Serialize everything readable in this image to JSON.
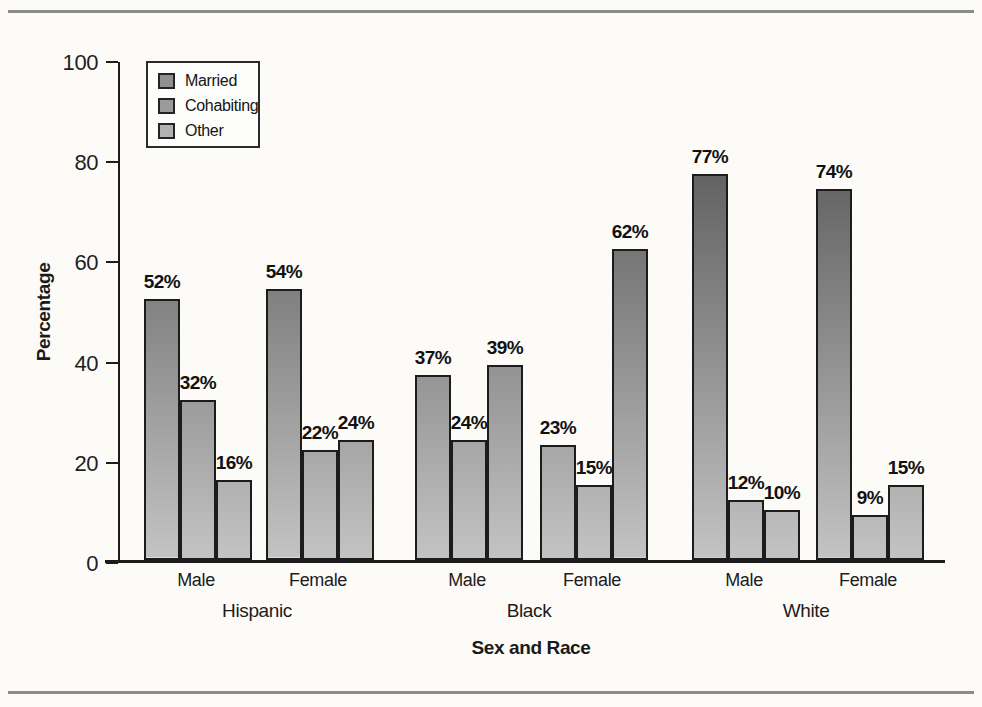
{
  "chart_data": {
    "type": "bar",
    "title": "",
    "ylabel": "Percentage",
    "xlabel": "Sex and Race",
    "ylim": [
      0,
      100
    ],
    "yticks": [
      0,
      20,
      40,
      60,
      80,
      100
    ],
    "legend": [
      "Married",
      "Cohabiting",
      "Other"
    ],
    "legend_position": "upper-left-inside",
    "grid": false,
    "races": [
      "Hispanic",
      "Black",
      "White"
    ],
    "groups": [
      {
        "race": "Hispanic",
        "sex": "Male",
        "values": [
          52,
          32,
          16
        ],
        "labels": [
          "52%",
          "32%",
          "16%"
        ]
      },
      {
        "race": "Hispanic",
        "sex": "Female",
        "values": [
          54,
          22,
          24
        ],
        "labels": [
          "54%",
          "22%",
          "24%"
        ]
      },
      {
        "race": "Black",
        "sex": "Male",
        "values": [
          37,
          24,
          39
        ],
        "labels": [
          "37%",
          "24%",
          "39%"
        ]
      },
      {
        "race": "Black",
        "sex": "Female",
        "values": [
          23,
          15,
          62
        ],
        "labels": [
          "23%",
          "15%",
          "62%"
        ]
      },
      {
        "race": "White",
        "sex": "Male",
        "values": [
          77,
          12,
          10
        ],
        "labels": [
          "77%",
          "12%",
          "10%"
        ]
      },
      {
        "race": "White",
        "sex": "Female",
        "values": [
          74,
          9,
          15
        ],
        "labels": [
          "74%",
          "9%",
          "15%"
        ]
      }
    ]
  },
  "colors": {
    "paper": "#fcfbf8",
    "rule": "#8c8c8c",
    "axis": "#1c1c1c",
    "bar_border": "#1c1c1c",
    "bar_gradient_top": "#454545",
    "bar_gradient_bottom": "#c3c3c3",
    "legend_swatches": [
      "#909090",
      "#9b9b9b",
      "#b1b1b1"
    ]
  }
}
